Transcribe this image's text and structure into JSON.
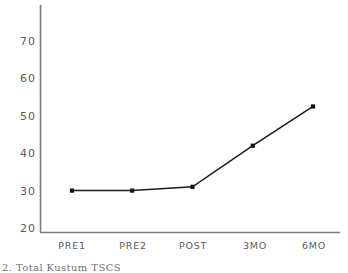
{
  "chart_data": {
    "type": "line",
    "title": "",
    "xlabel": "",
    "ylabel": "",
    "categories": [
      "PRE1",
      "PRE2",
      "POST",
      "3MO",
      "6MO"
    ],
    "values": [
      30,
      30,
      31,
      42,
      52.5
    ],
    "series": [
      {
        "name": "Total Kustum TSCS",
        "values": [
          30,
          30,
          31,
          42,
          52.5
        ]
      }
    ],
    "ylim": [
      20,
      75
    ],
    "yticks": [
      20,
      30,
      40,
      50,
      60,
      70
    ],
    "ytick_labels": [
      "20",
      "30",
      "40",
      "50",
      "60",
      "70"
    ],
    "grid": false,
    "legend": "none",
    "marker": "square",
    "line_color": "#1a1a1a",
    "marker_color": "#111111",
    "axis_color": "#666666",
    "background": "#ffffff"
  },
  "caption": {
    "text": "2.  Total Kustum   TSCS"
  },
  "axes": {
    "y_axis_name": "y-axis",
    "x_axis_name": "x-axis"
  }
}
